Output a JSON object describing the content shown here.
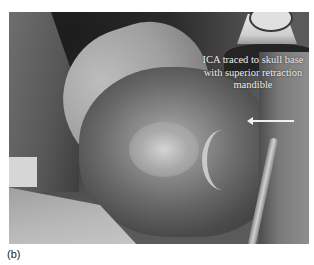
{
  "figure": {
    "panel_label": "(b)",
    "image_description": "grayscale intraoperative photograph of neck dissection",
    "annotation": {
      "line1": "ICA traced to skull base",
      "line2": "with superior retraction",
      "line3": "mandible"
    },
    "arrow": {
      "direction": "left",
      "color": "#f0f0f0"
    }
  }
}
